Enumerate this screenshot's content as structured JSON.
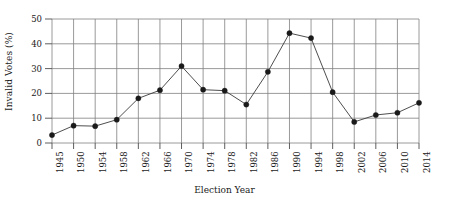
{
  "chart_data": {
    "type": "line",
    "title": "",
    "xlabel": "Election Year",
    "ylabel": "Invalid Votes (%)",
    "categories": [
      "1945",
      "1950",
      "1954",
      "1958",
      "1962",
      "1966",
      "1970",
      "1974",
      "1978",
      "1982",
      "1986",
      "1990",
      "1994",
      "1998",
      "2002",
      "2006",
      "2010",
      "2014"
    ],
    "x": [
      1945,
      1950,
      1954,
      1958,
      1962,
      1966,
      1970,
      1974,
      1978,
      1982,
      1986,
      1990,
      1994,
      1998,
      2002,
      2006,
      2010,
      2014
    ],
    "values": [
      3.2,
      7.0,
      6.8,
      9.4,
      18.0,
      21.3,
      31.0,
      21.5,
      21.1,
      15.5,
      28.7,
      44.3,
      42.3,
      20.5,
      8.5,
      11.3,
      12.2,
      16.2
    ],
    "series": [
      {
        "name": "Invalid Votes (%)",
        "values": [
          3.2,
          7.0,
          6.8,
          9.4,
          18.0,
          21.3,
          31.0,
          21.5,
          21.1,
          15.5,
          28.7,
          44.3,
          42.3,
          20.5,
          8.5,
          11.3,
          12.2,
          16.2
        ]
      }
    ],
    "ylim": [
      0,
      50
    ],
    "yticks": [
      "0",
      "10",
      "20",
      "30",
      "40",
      "50"
    ],
    "ytick_values": [
      0,
      10,
      20,
      30,
      40,
      50
    ],
    "xtick_labels": [
      "1945",
      "1950",
      "1954",
      "1958",
      "1962",
      "1966",
      "1970",
      "1974",
      "1978",
      "1982",
      "1986",
      "1990",
      "1994",
      "1998",
      "2002",
      "2006",
      "2010",
      "2014"
    ],
    "grid": "both",
    "legend_position": "none",
    "marker": "filled-circle",
    "colors": {
      "line": "#3a3a3a",
      "marker": "#1a1a1a",
      "grid": "#808080",
      "axis": "#4d4d4d",
      "background": "#ffffff",
      "text": "#1a1a1a"
    }
  }
}
